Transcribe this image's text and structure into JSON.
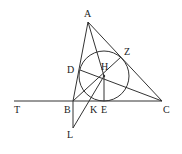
{
  "points": {
    "A": {
      "label": "A",
      "x": 88,
      "y": 22
    },
    "B": {
      "label": "B",
      "x": 73,
      "y": 101
    },
    "C": {
      "label": "C",
      "x": 162,
      "y": 101
    },
    "T": {
      "label": "T",
      "x": 14,
      "y": 101
    },
    "H": {
      "label": "H",
      "x": 104,
      "y": 76
    },
    "D": {
      "label": "D",
      "x": 80,
      "y": 70
    },
    "Z": {
      "label": "Z",
      "x": 121,
      "y": 57
    },
    "E": {
      "label": "E",
      "x": 104,
      "y": 101
    },
    "K": {
      "label": "K",
      "x": 90,
      "y": 101
    },
    "L": {
      "label": "L",
      "x": 73,
      "y": 128
    }
  },
  "circle": {
    "center": "H",
    "radius": 25
  },
  "colors": {
    "stroke": "#333333",
    "background": "#ffffff"
  }
}
